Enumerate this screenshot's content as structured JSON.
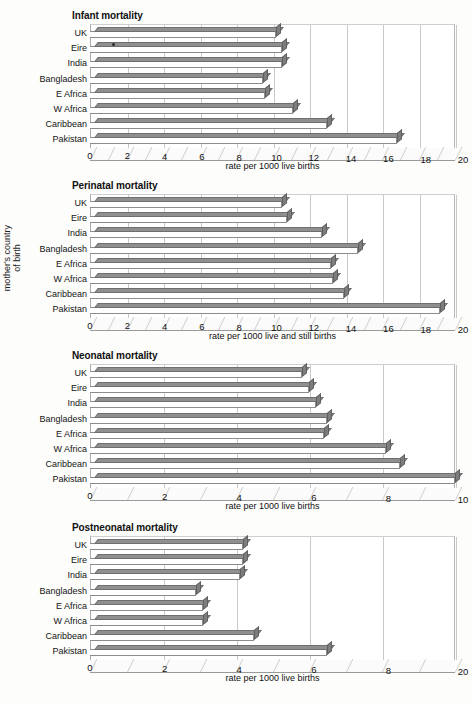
{
  "y_axis_label": {
    "line1": "mother's country",
    "line2": "of birth"
  },
  "categories": [
    "UK",
    "Eire",
    "India",
    "Bangladesh",
    "E Africa",
    "W Africa",
    "Caribbean",
    "Pakistan"
  ],
  "chart_data": [
    {
      "type": "bar",
      "title": "Infant mortality",
      "orientation": "horizontal",
      "categories": [
        "UK",
        "Eire",
        "India",
        "Bangladesh",
        "E Africa",
        "W Africa",
        "Caribbean",
        "Pakistan"
      ],
      "values": [
        10.2,
        10.5,
        10.5,
        9.5,
        9.6,
        11.1,
        13.0,
        16.8
      ],
      "xlabel": "rate per 1000 live births",
      "ylabel": "mother's country of birth",
      "xlim": [
        0,
        20
      ],
      "xticks": [
        0,
        2,
        4,
        6,
        8,
        10,
        12,
        14,
        16,
        18,
        20
      ],
      "xticklabels": [
        "0",
        "2",
        "4",
        "6",
        "8",
        "10",
        "12",
        "14",
        "16",
        "18",
        "20"
      ],
      "grid": true,
      "legend": "none"
    },
    {
      "type": "bar",
      "title": "Perinatal mortality",
      "orientation": "horizontal",
      "categories": [
        "UK",
        "Eire",
        "India",
        "Bangladesh",
        "E Africa",
        "W Africa",
        "Caribbean",
        "Pakistan"
      ],
      "values": [
        10.5,
        10.8,
        12.7,
        14.7,
        13.2,
        13.3,
        13.9,
        19.2
      ],
      "xlabel": "rate per 1000 live and still births",
      "ylabel": "mother's country of birth",
      "xlim": [
        0,
        20
      ],
      "xticks": [
        0,
        2,
        4,
        6,
        8,
        10,
        12,
        14,
        16,
        18,
        20
      ],
      "xticklabels": [
        "0",
        "2",
        "4",
        "6",
        "8",
        "10",
        "12",
        "14",
        "16",
        "18",
        "20"
      ],
      "grid": true,
      "legend": "none"
    },
    {
      "type": "bar",
      "title": "Neonatal mortality",
      "orientation": "horizontal",
      "categories": [
        "UK",
        "Eire",
        "India",
        "Bangladesh",
        "E Africa",
        "W Africa",
        "Caribbean",
        "Pakistan"
      ],
      "values": [
        5.8,
        6.0,
        6.2,
        6.5,
        6.4,
        8.1,
        8.5,
        10.0
      ],
      "xlabel": "rate per 1000 live births",
      "ylabel": "mother's country of birth",
      "xlim": [
        0,
        10
      ],
      "xticks": [
        0,
        2,
        4,
        6,
        8,
        10
      ],
      "xticklabels": [
        "0",
        "2",
        "4",
        "6",
        "8",
        "10"
      ],
      "grid": true,
      "legend": "none"
    },
    {
      "type": "bar",
      "title": "Postneonatal mortality",
      "orientation": "horizontal",
      "categories": [
        "UK",
        "Eire",
        "India",
        "Bangladesh",
        "E Africa",
        "W Africa",
        "Caribbean",
        "Pakistan"
      ],
      "values": [
        4.2,
        4.2,
        4.1,
        2.9,
        3.1,
        3.1,
        4.5,
        6.5
      ],
      "xlabel": "rate per 1000 live births",
      "ylabel": "mother's country of birth",
      "xlim": [
        0,
        10
      ],
      "xticks": [
        0,
        2,
        4,
        6,
        8,
        10
      ],
      "xticklabels": [
        "0",
        "2",
        "4",
        "6",
        "8",
        "20"
      ],
      "grid": true,
      "legend": "none"
    }
  ]
}
